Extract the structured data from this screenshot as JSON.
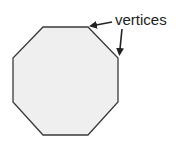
{
  "diagram": {
    "shape": "octagon",
    "fill": "#efefef",
    "stroke": "#3a3a3a",
    "points": "43,27 88,27 118,58 118,102 88,135 43,135 13,102 13,58",
    "annotation": {
      "label": "vertices",
      "arrows": [
        {
          "from": [
            112,
            22
          ],
          "to": [
            90,
            26
          ]
        },
        {
          "from": [
            122,
            29
          ],
          "to": [
            119,
            55
          ]
        }
      ]
    }
  }
}
